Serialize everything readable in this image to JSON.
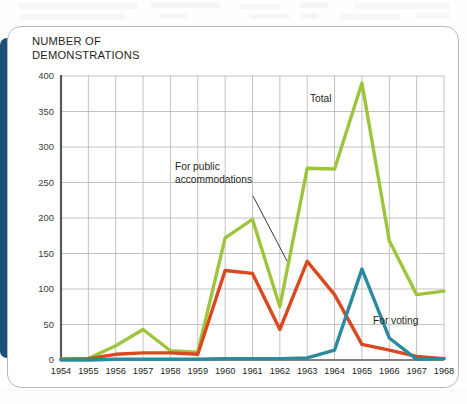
{
  "card": {
    "title": "NUMBER OF\nDEMONSTRATIONS"
  },
  "colors": {
    "total": "#9ec43c",
    "public_accommodations": "#d9481f",
    "voting": "#2b8a9e",
    "accent_bar": "#1d5078",
    "grid": "#b3b3b3",
    "axis": "#58585a",
    "card_border": "#b9b9b9",
    "text": "#231f20"
  },
  "annotations": [
    {
      "name": "total-label",
      "text": "Total",
      "x": 310,
      "y": 102,
      "anchor": "start"
    },
    {
      "name": "public-accommodations-label",
      "text": "For public\naccommodations",
      "x": 175,
      "y": 170,
      "anchor": "start"
    },
    {
      "name": "voting-label",
      "text": "For voting",
      "x": 373,
      "y": 324,
      "anchor": "start"
    }
  ],
  "leader_line": {
    "x1": 253,
    "y1": 196,
    "x2": 287,
    "y2": 261
  },
  "chart_data": {
    "type": "line",
    "title": "NUMBER OF DEMONSTRATIONS",
    "xlabel": "",
    "ylabel": "NUMBER OF DEMONSTRATIONS",
    "x": [
      1954,
      1955,
      1956,
      1957,
      1958,
      1959,
      1960,
      1961,
      1962,
      1963,
      1964,
      1965,
      1966,
      1967,
      1968
    ],
    "categories": [
      "1954",
      "1955",
      "1956",
      "1957",
      "1958",
      "1959",
      "1960",
      "1961",
      "1962",
      "1963",
      "1964",
      "1965",
      "1966",
      "1967",
      "1968"
    ],
    "xlim": [
      1954,
      1968
    ],
    "ylim": [
      0,
      400
    ],
    "yticks": [
      0,
      50,
      100,
      150,
      200,
      250,
      300,
      350,
      400
    ],
    "ytick_labels": [
      "0",
      "50",
      "100",
      "150",
      "200",
      "250",
      "300",
      "350",
      "400"
    ],
    "grid": true,
    "legend": "inline-annotations",
    "series": [
      {
        "name": "Total",
        "color": "#9ec43c",
        "values": [
          1,
          2,
          20,
          43,
          13,
          11,
          172,
          198,
          75,
          270,
          269,
          390,
          168,
          92,
          97
        ]
      },
      {
        "name": "For public accommodations",
        "color": "#d9481f",
        "values": [
          1,
          2,
          8,
          10,
          10,
          8,
          126,
          122,
          43,
          139,
          92,
          22,
          14,
          5,
          2
        ]
      },
      {
        "name": "For voting",
        "color": "#2b8a9e",
        "values": [
          0,
          0,
          1,
          1,
          1,
          1,
          2,
          2,
          2,
          3,
          14,
          128,
          31,
          1,
          2
        ]
      }
    ]
  }
}
